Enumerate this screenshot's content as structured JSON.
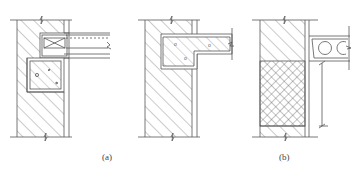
{
  "figure": {
    "captions": {
      "a": "(a)",
      "b": "(b)"
    },
    "panels": [
      {
        "id": "a-left",
        "description": "Brick wall with concrete ring beam (hatched block with aggregate) and precast slab resting on it, with wood-block (X) infill at slab end",
        "elements": [
          "brick-wall-hatch",
          "ring-beam",
          "precast-slab",
          "wood-block-x",
          "break-symbol-top",
          "break-symbol-bottom"
        ]
      },
      {
        "id": "a-right",
        "description": "Brick wall with cast-in-place concrete slab/beam end embedded in wall",
        "elements": [
          "brick-wall-hatch",
          "cast-in-place-slab",
          "break-symbol-top",
          "break-symbol-bottom"
        ]
      },
      {
        "id": "b",
        "description": "Wall with brick upper part and cross-hatched infill lower part, hollow-core precast slab with dimension line",
        "elements": [
          "brick-wall-hatch",
          "crosshatch-infill",
          "hollow-core-slab",
          "dimension-line",
          "break-symbol-top",
          "break-symbol-bottom"
        ]
      }
    ],
    "colors": {
      "line": "#555555",
      "background": "#ffffff"
    }
  }
}
